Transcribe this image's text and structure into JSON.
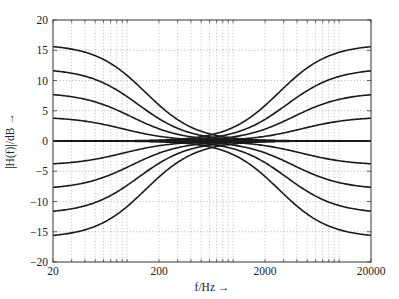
{
  "chart_data": {
    "type": "line",
    "title": "",
    "xlabel": "f/Hz →",
    "ylabel": "|H(f)|/dB →",
    "xscale": "log",
    "xlim": [
      20,
      20000
    ],
    "ylim": [
      -20,
      20
    ],
    "xticks": [
      20,
      200,
      2000,
      20000
    ],
    "xtick_labels": [
      "20",
      "200",
      "2000",
      "20000"
    ],
    "yticks": [
      20,
      15,
      10,
      5,
      0,
      -5,
      -10,
      -15,
      -20
    ],
    "ytick_labels": [
      "20",
      "15",
      "10",
      "5",
      "0",
      "−5",
      "−10",
      "−15",
      "−20"
    ],
    "grid": true,
    "grid_style": "dotted",
    "legend": null,
    "line_color": "#1a1a1a",
    "grid_color": "#9a9a9a",
    "series": [
      {
        "name": "low shelf +16 dB",
        "gain_db": 16,
        "side": "low",
        "half_gain_hz": 150
      },
      {
        "name": "low shelf +12 dB",
        "gain_db": 12,
        "side": "low",
        "half_gain_hz": 128
      },
      {
        "name": "low shelf +8 dB",
        "gain_db": 8,
        "side": "low",
        "half_gain_hz": 110
      },
      {
        "name": "low shelf +4 dB",
        "gain_db": 4,
        "side": "low",
        "half_gain_hz": 92
      },
      {
        "name": "low shelf -4 dB",
        "gain_db": -4,
        "side": "low",
        "half_gain_hz": 92
      },
      {
        "name": "low shelf -8 dB",
        "gain_db": -8,
        "side": "low",
        "half_gain_hz": 110
      },
      {
        "name": "low shelf -12 dB",
        "gain_db": -12,
        "side": "low",
        "half_gain_hz": 128
      },
      {
        "name": "low shelf -16 dB",
        "gain_db": -16,
        "side": "low",
        "half_gain_hz": 150
      },
      {
        "name": "high shelf +16 dB",
        "gain_db": 16,
        "side": "high",
        "half_gain_hz": 2700
      },
      {
        "name": "high shelf +12 dB",
        "gain_db": 12,
        "side": "high",
        "half_gain_hz": 3200
      },
      {
        "name": "high shelf +8 dB",
        "gain_db": 8,
        "side": "high",
        "half_gain_hz": 3700
      },
      {
        "name": "high shelf +4 dB",
        "gain_db": 4,
        "side": "high",
        "half_gain_hz": 4400
      },
      {
        "name": "high shelf -4 dB",
        "gain_db": -4,
        "side": "high",
        "half_gain_hz": 4400
      },
      {
        "name": "high shelf -8 dB",
        "gain_db": -8,
        "side": "high",
        "half_gain_hz": 3700
      },
      {
        "name": "high shelf -12 dB",
        "gain_db": -12,
        "side": "high",
        "half_gain_hz": 3200
      },
      {
        "name": "high shelf -16 dB",
        "gain_db": -16,
        "side": "high",
        "half_gain_hz": 2700
      },
      {
        "name": "flat 0 dB",
        "gain_db": 0,
        "side": "flat",
        "half_gain_hz": null
      }
    ],
    "sample_points": {
      "x_hz": [
        20,
        50,
        100,
        150,
        200,
        300,
        630,
        1300,
        2000,
        2700,
        4000,
        8000,
        20000
      ],
      "low_shelf_+16_db": [
        16,
        15.7,
        13.5,
        8,
        3.5,
        0.8,
        0,
        0,
        0,
        0,
        0,
        0,
        0
      ],
      "high_shelf_+16_db": [
        0,
        0,
        0,
        0,
        0,
        0,
        0,
        0.8,
        3.5,
        8,
        13.5,
        15.7,
        16
      ]
    }
  }
}
